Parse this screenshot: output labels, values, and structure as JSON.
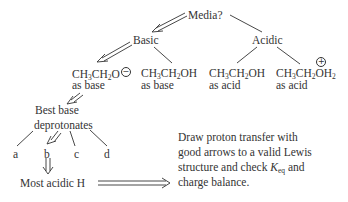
{
  "diagram": {
    "root": "Media?",
    "branches": [
      {
        "label": "Basic",
        "arrow": "double",
        "children": [
          {
            "formula": "CH3CH2O⊖",
            "role": "as base",
            "arrow": "double"
          },
          {
            "formula": "CH3CH2OH",
            "role": "as base",
            "arrow": "single"
          }
        ]
      },
      {
        "label": "Acidic",
        "arrow": "single",
        "children": [
          {
            "formula": "CH3CH2OH",
            "role": "as acid",
            "arrow": "single"
          },
          {
            "formula": "CH3CH2OH2⊕",
            "role": "as acid",
            "arrow": "single"
          }
        ]
      }
    ],
    "step2": {
      "line1": "Best base",
      "line2": "deprotonates"
    },
    "options": [
      "a",
      "b",
      "c",
      "d"
    ],
    "step3": "Most acidic H",
    "instruction": {
      "line1": "Draw proton transfer with",
      "line2": "good arrows to a valid Lewis",
      "line3_pre": "structure and check ",
      "k_symbol": "K",
      "k_sub": "eq",
      "line3_post": " and",
      "line4": "charge balance."
    }
  },
  "labels": {
    "root": "Media?",
    "basic": "Basic",
    "acidic": "Acidic",
    "as_base": "as base",
    "as_acid": "as acid",
    "ch": "CH",
    "sub3": "3",
    "sub2": "2",
    "o": "O",
    "oh": "OH",
    "h": "H",
    "minus": "−",
    "plus": "+"
  }
}
